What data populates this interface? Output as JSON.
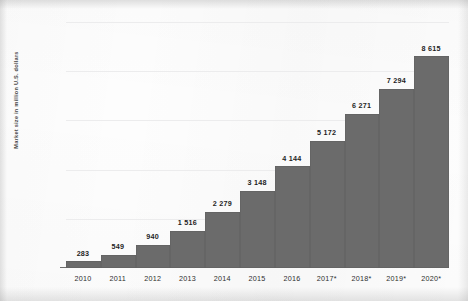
{
  "chart_data": {
    "type": "bar",
    "title": "",
    "subtitle": "",
    "xlabel": "",
    "ylabel": "Market size in million U.S. dollars",
    "categories": [
      "2010",
      "2011",
      "2012",
      "2013",
      "2014",
      "2015",
      "2016",
      "2017*",
      "2018*",
      "2019*",
      "2020*"
    ],
    "values": [
      283,
      549,
      940,
      1516,
      2279,
      3148,
      4144,
      5172,
      6271,
      7294,
      8615
    ],
    "value_labels": [
      "283",
      "549",
      "940",
      "1 516",
      "2 279",
      "3 148",
      "4 144",
      "5 172",
      "6 271",
      "7 294",
      "8 615"
    ],
    "ylim": [
      0,
      10000
    ],
    "ytick_values": [
      0,
      2000,
      4000,
      6000,
      8000,
      10000
    ],
    "ytick_labels": [
      "0",
      "2 000",
      "4 000",
      "6 000",
      "8 000",
      "10 000"
    ],
    "grid": true,
    "legend": "none",
    "series": [
      {
        "name": "Market size",
        "values": [
          283,
          549,
          940,
          1516,
          2279,
          3148,
          4144,
          5172,
          6271,
          7294,
          8615
        ]
      }
    ],
    "colors": {
      "bar": "#6b6b6b",
      "gridline": "#ececed",
      "axis": "#6e6e6e",
      "background": "#fdfdfd",
      "value_label": "#1e1e1e",
      "tick_label": "#3f3f3f"
    }
  }
}
